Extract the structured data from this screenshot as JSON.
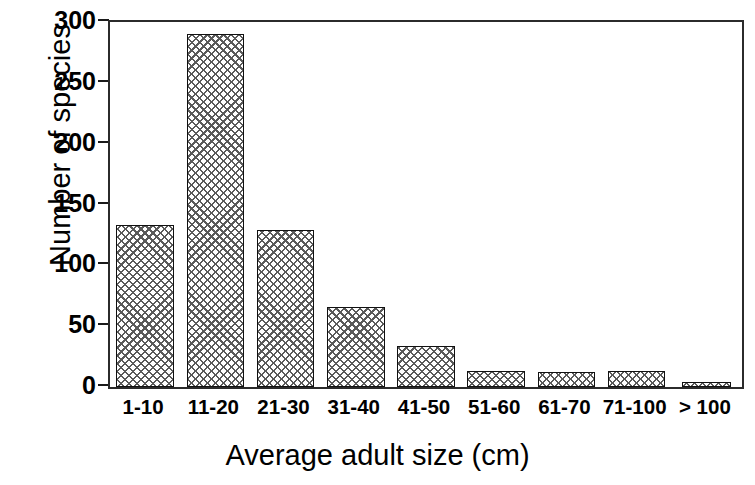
{
  "chart_data": {
    "type": "bar",
    "title": "",
    "xlabel": "Average adult size (cm)",
    "ylabel": "Number of species",
    "categories": [
      "1-10",
      "11-20",
      "21-30",
      "31-40",
      "41-50",
      "51-60",
      "61-70",
      "71-100",
      "> 100"
    ],
    "values": [
      133,
      290,
      129,
      66,
      34,
      13,
      12,
      13,
      4
    ],
    "ylim": [
      0,
      300
    ],
    "yticks": [
      0,
      50,
      100,
      150,
      200,
      250,
      300
    ],
    "ytick_labels": [
      "0",
      "50",
      "100",
      "150",
      "200",
      "250",
      "300"
    ],
    "grid": false,
    "legend": "none",
    "bar_fill": "crosshatch",
    "bar_fill_color": "#5a5a5a",
    "bar_edge_color": "#111111",
    "axis_color": "#2b2b2b",
    "background": "#ffffff"
  }
}
